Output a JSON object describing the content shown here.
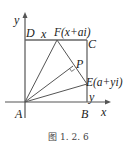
{
  "figure": {
    "caption": "图 1. 2. 6",
    "axes": {
      "x_label": "x",
      "y_label": "y"
    },
    "points": {
      "A": "A",
      "B": "B",
      "C": "C",
      "D": "D",
      "F": "F(x+ai)",
      "E": "E(a+yi)",
      "P": "P"
    },
    "segment_labels": {
      "DF": "x",
      "BE": "y"
    },
    "colors": {
      "line": "#555555",
      "text": "#222222"
    }
  }
}
